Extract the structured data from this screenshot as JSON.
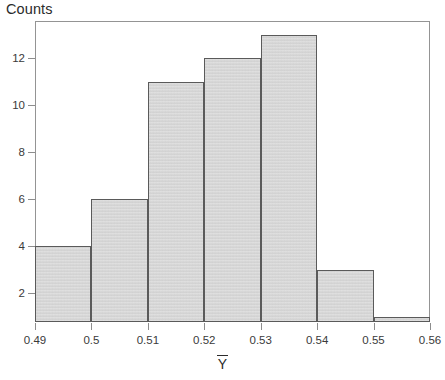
{
  "chart": {
    "title": "Counts",
    "x_axis_title_base": "Y",
    "x_axis_title_accent": "overline"
  },
  "chart_data": {
    "type": "bar",
    "subtype": "histogram",
    "title": "Counts",
    "xlabel": "Ȳ",
    "ylabel": "Counts",
    "grid": false,
    "legend": false,
    "bin_edges": [
      0.49,
      0.5,
      0.51,
      0.52,
      0.53,
      0.54,
      0.55,
      0.56
    ],
    "categories": [
      "0.49-0.50",
      "0.50-0.51",
      "0.51-0.52",
      "0.52-0.53",
      "0.53-0.54",
      "0.54-0.55",
      "0.55-0.56"
    ],
    "values": [
      4,
      6,
      11,
      12,
      13,
      3,
      1
    ],
    "xlim": [
      0.49,
      0.56
    ],
    "ylim": [
      0,
      13.4
    ],
    "xticks": [
      0.49,
      0.5,
      0.51,
      0.52,
      0.53,
      0.54,
      0.55,
      0.56
    ],
    "xticklabels": [
      "0.49",
      "0.5",
      "0.51",
      "0.52",
      "0.53",
      "0.54",
      "0.55",
      "0.56"
    ],
    "yticks": [
      2,
      4,
      6,
      8,
      10,
      12
    ],
    "yticklabels": [
      "2",
      "4",
      "6",
      "8",
      "10",
      "12"
    ],
    "bar_fill_color": "#d8d8d8",
    "bar_border_color": "#5a5a5a",
    "axis_color": "#8d8d8d",
    "text_color": "#2b2b2b",
    "total_count": 50
  }
}
